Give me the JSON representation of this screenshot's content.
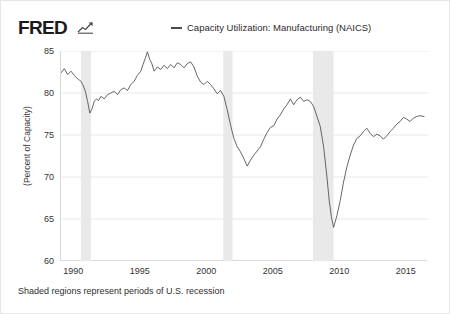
{
  "header": {
    "logo_text": "FRED",
    "logo_mark": "fred-chart-mark",
    "legend_label": "Capacity Utilization: Manufacturing (NAICS)",
    "legend_color": "#4a4a55"
  },
  "footer": {
    "note": "Shaded regions represent periods of U.S. recession"
  },
  "chart_data": {
    "type": "line",
    "title": "",
    "subtitle": "",
    "xlabel": "",
    "ylabel": "(Percent of Capacity)",
    "xlim": [
      1989.0,
      2016.6
    ],
    "ylim": [
      60,
      85
    ],
    "yticks": [
      85,
      80,
      75,
      70,
      65,
      60
    ],
    "xticks": [
      1990,
      1995,
      2000,
      2005,
      2010,
      2015
    ],
    "xtick_labels": [
      "1990",
      "1995",
      "2000",
      "2005",
      "2010",
      "2015"
    ],
    "ytick_labels": [
      "85",
      "80",
      "75",
      "70",
      "65",
      "60"
    ],
    "grid": "horizontal",
    "grid_color": "#e8e8e8",
    "legend_position": "top-center",
    "line_color": "#53535f",
    "line_width": 0.9,
    "shaded_regions": [
      {
        "label": "1990-91 recession",
        "start": 1990.5,
        "end": 1991.25
      },
      {
        "label": "2001 recession",
        "start": 2001.2,
        "end": 2001.9
      },
      {
        "label": "2007-09 recession",
        "start": 2007.95,
        "end": 2009.5
      }
    ],
    "shade_color": "#e9e9e9",
    "series": [
      {
        "name": "Capacity Utilization: Manufacturing (NAICS)",
        "x": [
          1989.0,
          1989.25,
          1989.5,
          1989.75,
          1990.0,
          1990.17,
          1990.33,
          1990.5,
          1990.67,
          1990.83,
          1991.0,
          1991.17,
          1991.33,
          1991.5,
          1991.67,
          1991.83,
          1992.0,
          1992.25,
          1992.5,
          1992.75,
          1993.0,
          1993.25,
          1993.5,
          1993.75,
          1994.0,
          1994.25,
          1994.5,
          1994.75,
          1995.0,
          1995.17,
          1995.33,
          1995.5,
          1995.67,
          1995.83,
          1996.0,
          1996.25,
          1996.5,
          1996.75,
          1997.0,
          1997.25,
          1997.5,
          1997.75,
          1998.0,
          1998.25,
          1998.5,
          1998.75,
          1999.0,
          1999.25,
          1999.5,
          1999.75,
          2000.0,
          2000.25,
          2000.5,
          2000.75,
          2001.0,
          2001.25,
          2001.5,
          2001.75,
          2002.0,
          2002.25,
          2002.5,
          2002.75,
          2003.0,
          2003.25,
          2003.5,
          2003.75,
          2004.0,
          2004.25,
          2004.5,
          2004.75,
          2005.0,
          2005.25,
          2005.5,
          2005.75,
          2006.0,
          2006.25,
          2006.5,
          2006.75,
          2007.0,
          2007.25,
          2007.5,
          2007.75,
          2008.0,
          2008.25,
          2008.5,
          2008.75,
          2009.0,
          2009.17,
          2009.33,
          2009.5,
          2009.75,
          2010.0,
          2010.25,
          2010.5,
          2010.75,
          2011.0,
          2011.25,
          2011.5,
          2011.75,
          2012.0,
          2012.25,
          2012.5,
          2012.75,
          2013.0,
          2013.25,
          2013.5,
          2013.75,
          2014.0,
          2014.25,
          2014.5,
          2014.75,
          2015.0,
          2015.25,
          2015.5,
          2015.75,
          2016.0,
          2016.3
        ],
        "values": [
          82.4,
          82.9,
          82.2,
          82.6,
          82.1,
          81.8,
          81.6,
          81.4,
          80.9,
          80.2,
          79.0,
          77.6,
          78.1,
          79.0,
          79.3,
          79.1,
          79.6,
          79.3,
          79.8,
          80.0,
          80.2,
          79.8,
          80.4,
          80.6,
          80.3,
          81.0,
          81.4,
          82.1,
          82.6,
          83.4,
          84.1,
          84.9,
          84.0,
          83.5,
          82.6,
          83.1,
          82.8,
          83.3,
          82.9,
          83.4,
          83.0,
          83.6,
          83.4,
          83.0,
          83.5,
          83.7,
          83.1,
          82.0,
          81.3,
          81.0,
          81.4,
          81.0,
          80.5,
          79.9,
          80.3,
          79.6,
          78.0,
          76.2,
          74.6,
          73.6,
          73.0,
          72.2,
          71.3,
          72.0,
          72.6,
          73.1,
          73.6,
          74.5,
          75.3,
          75.9,
          76.1,
          76.9,
          77.4,
          78.1,
          78.6,
          79.3,
          78.6,
          79.2,
          79.5,
          79.0,
          79.2,
          79.0,
          78.4,
          77.2,
          76.0,
          73.6,
          70.0,
          67.2,
          65.3,
          64.0,
          65.4,
          67.2,
          69.4,
          71.2,
          72.6,
          73.8,
          74.6,
          74.9,
          75.4,
          75.8,
          75.2,
          74.8,
          75.1,
          74.9,
          74.5,
          74.9,
          75.4,
          75.8,
          76.3,
          76.6,
          77.1,
          76.9,
          76.6,
          77.0,
          77.2,
          77.3,
          77.2
        ]
      }
    ]
  }
}
